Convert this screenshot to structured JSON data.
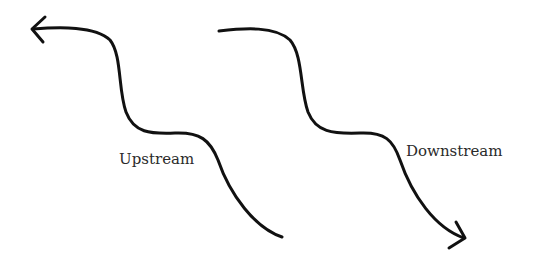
{
  "diagram": {
    "arrows": [
      {
        "id": "upstream",
        "direction": "up-left",
        "label": "Upstream"
      },
      {
        "id": "downstream",
        "direction": "down-right",
        "label": "Downstream"
      }
    ],
    "colors": {
      "stroke": "#111111",
      "text": "#2a2a2a",
      "background": "#ffffff"
    }
  }
}
